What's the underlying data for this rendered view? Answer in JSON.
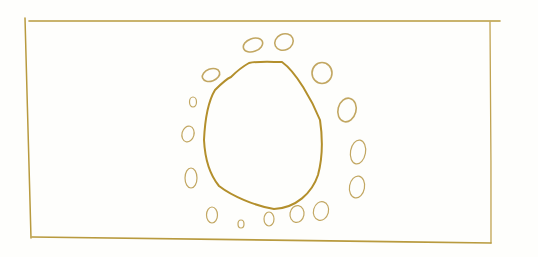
{
  "drawing": {
    "description": "Hand-drawn ochre sketch: rectangular frame enclosing a large irregular circle ringed by fifteen small ovals",
    "colors": {
      "background": "#fefefc",
      "frame_stroke": "#b89a3e",
      "big_shape_stroke": "#b38f2c",
      "oval_stroke": "#c2a762"
    },
    "frame": {
      "corners": [
        [
          25,
          20
        ],
        [
          503,
          21
        ],
        [
          491,
          244
        ],
        [
          31,
          238
        ]
      ]
    },
    "center_shape": {
      "label": "large-irregular-circle"
    },
    "ovals": [
      {
        "cx": 253,
        "cy": 45,
        "rx": 10,
        "ry": 6.5,
        "rot": -20
      },
      {
        "cx": 284,
        "cy": 42,
        "rx": 9.5,
        "ry": 8,
        "rot": -25
      },
      {
        "cx": 211,
        "cy": 75,
        "rx": 9,
        "ry": 6,
        "rot": -20
      },
      {
        "cx": 322,
        "cy": 73,
        "rx": 10,
        "ry": 10.5,
        "rot": 0
      },
      {
        "cx": 193,
        "cy": 102,
        "rx": 3.5,
        "ry": 5,
        "rot": 0
      },
      {
        "cx": 347,
        "cy": 110,
        "rx": 9,
        "ry": 12,
        "rot": 15
      },
      {
        "cx": 188,
        "cy": 134,
        "rx": 6,
        "ry": 8,
        "rot": 15
      },
      {
        "cx": 358,
        "cy": 152,
        "rx": 7.5,
        "ry": 12,
        "rot": 10
      },
      {
        "cx": 191,
        "cy": 178,
        "rx": 6,
        "ry": 10,
        "rot": 0
      },
      {
        "cx": 357,
        "cy": 187,
        "rx": 7.5,
        "ry": 11,
        "rot": 10
      },
      {
        "cx": 212,
        "cy": 215,
        "rx": 5.5,
        "ry": 8,
        "rot": 0
      },
      {
        "cx": 241,
        "cy": 224,
        "rx": 3,
        "ry": 4,
        "rot": 0
      },
      {
        "cx": 269,
        "cy": 219,
        "rx": 5,
        "ry": 7,
        "rot": 0
      },
      {
        "cx": 297,
        "cy": 214,
        "rx": 7,
        "ry": 8.5,
        "rot": 10
      },
      {
        "cx": 321,
        "cy": 211,
        "rx": 7.5,
        "ry": 9.5,
        "rot": 15
      }
    ]
  }
}
